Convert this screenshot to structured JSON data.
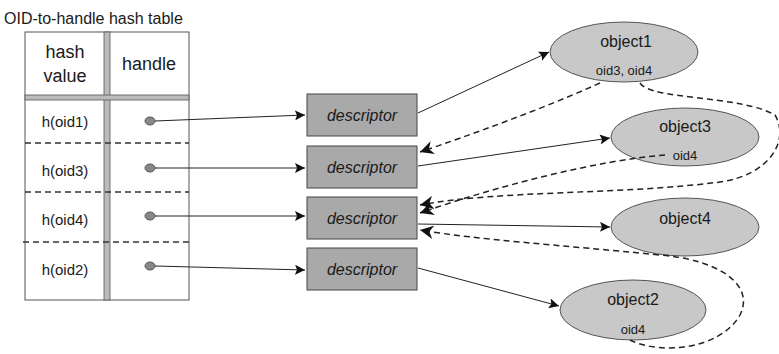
{
  "title": "OID-to-handle  hash table",
  "table": {
    "headers": {
      "hash_line1": "hash",
      "hash_line2": "value",
      "handle": "handle"
    },
    "rows": [
      {
        "hash": "h(oid1)"
      },
      {
        "hash": "h(oid3)"
      },
      {
        "hash": "h(oid4)"
      },
      {
        "hash": "h(oid2)"
      }
    ]
  },
  "descriptors": [
    {
      "label": "descriptor"
    },
    {
      "label": "descriptor"
    },
    {
      "label": "descriptor"
    },
    {
      "label": "descriptor"
    }
  ],
  "objects": [
    {
      "name": "object1",
      "refs": "oid3, oid4"
    },
    {
      "name": "object3",
      "refs": "oid4"
    },
    {
      "name": "object4",
      "refs": ""
    },
    {
      "name": "object2",
      "refs": "oid4"
    }
  ],
  "colors": {
    "fill": "#c8c8c8",
    "descriptor_fill": "#a9a9a9",
    "stroke": "#555555",
    "line": "#222222"
  }
}
